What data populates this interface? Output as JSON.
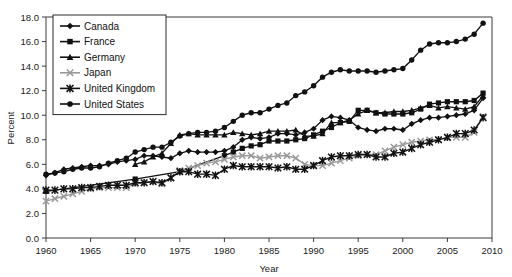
{
  "chart_data": {
    "type": "line",
    "title": "",
    "xlabel": "Year",
    "ylabel": "Percent",
    "xlim": [
      1960,
      2010
    ],
    "ylim": [
      0.0,
      18.0
    ],
    "xticks": [
      "1960",
      "1965",
      "1970",
      "1975",
      "1980",
      "1985",
      "1990",
      "1995",
      "2000",
      "2005",
      "2010"
    ],
    "yticks": [
      "0.0",
      "2.0",
      "4.0",
      "6.0",
      "8.0",
      "10.0",
      "12.0",
      "14.0",
      "16.0",
      "18.0"
    ],
    "grid": false,
    "legend_position": "top-left",
    "series": [
      {
        "name": "Canada",
        "marker": "diamond",
        "color": "#111111",
        "x": [
          1960,
          1961,
          1962,
          1963,
          1964,
          1965,
          1966,
          1967,
          1968,
          1969,
          1970,
          1971,
          1972,
          1973,
          1974,
          1975,
          1976,
          1977,
          1978,
          1979,
          1980,
          1981,
          1982,
          1983,
          1984,
          1985,
          1986,
          1987,
          1988,
          1989,
          1990,
          1991,
          1992,
          1993,
          1994,
          1995,
          1996,
          1997,
          1998,
          1999,
          2000,
          2001,
          2002,
          2003,
          2004,
          2005,
          2006,
          2007,
          2008,
          2009
        ],
        "values": [
          5.1,
          5.3,
          5.6,
          5.7,
          5.8,
          5.9,
          5.9,
          6.0,
          6.2,
          6.3,
          6.4,
          6.7,
          6.7,
          6.6,
          6.5,
          6.9,
          7.1,
          7.0,
          7.0,
          7.0,
          7.1,
          7.4,
          8.0,
          8.2,
          8.1,
          8.2,
          8.5,
          8.5,
          8.4,
          8.6,
          8.9,
          9.6,
          9.9,
          9.8,
          9.6,
          9.0,
          8.8,
          8.7,
          8.9,
          8.9,
          8.8,
          9.3,
          9.6,
          9.8,
          9.8,
          9.9,
          10.0,
          10.1,
          10.4,
          11.4
        ]
      },
      {
        "name": "France",
        "marker": "square",
        "color": "#111111",
        "x": [
          1960,
          1970,
          1975,
          1980,
          1981,
          1982,
          1983,
          1984,
          1985,
          1986,
          1987,
          1988,
          1989,
          1990,
          1991,
          1992,
          1993,
          1994,
          1995,
          1996,
          1997,
          1998,
          1999,
          2000,
          2001,
          2002,
          2003,
          2004,
          2005,
          2006,
          2007,
          2008,
          2009
        ],
        "values": [
          3.8,
          4.8,
          5.4,
          6.7,
          7.0,
          7.3,
          7.5,
          7.6,
          7.9,
          7.9,
          7.9,
          8.0,
          8.1,
          8.4,
          8.7,
          9.0,
          9.4,
          9.5,
          10.4,
          10.4,
          10.2,
          10.1,
          10.1,
          10.1,
          10.2,
          10.5,
          10.9,
          11.0,
          11.1,
          11.1,
          11.1,
          11.2,
          11.8
        ]
      },
      {
        "name": "Germany",
        "marker": "triangle",
        "color": "#111111",
        "x": [
          1970,
          1971,
          1972,
          1973,
          1974,
          1975,
          1976,
          1977,
          1978,
          1979,
          1980,
          1981,
          1982,
          1983,
          1984,
          1985,
          1986,
          1987,
          1988,
          1989,
          1990,
          1991,
          1992,
          1993,
          1994,
          1995,
          1996,
          1997,
          1998,
          1999,
          2000,
          2001,
          2002,
          2003,
          2004,
          2005,
          2006,
          2007,
          2008,
          2009
        ],
        "values": [
          6.0,
          6.2,
          6.6,
          6.9,
          7.7,
          8.4,
          8.5,
          8.4,
          8.4,
          8.4,
          8.4,
          8.6,
          8.5,
          8.4,
          8.5,
          8.7,
          8.7,
          8.7,
          8.8,
          8.3,
          8.3,
          8.5,
          9.4,
          9.4,
          9.6,
          10.1,
          10.4,
          10.2,
          10.2,
          10.3,
          10.3,
          10.4,
          10.6,
          10.8,
          10.6,
          10.7,
          10.6,
          10.5,
          10.7,
          11.6
        ]
      },
      {
        "name": "Japan",
        "marker": "cross",
        "color": "#9a9a9a",
        "x": [
          1960,
          1961,
          1962,
          1963,
          1964,
          1965,
          1966,
          1967,
          1968,
          1969,
          1970,
          1971,
          1972,
          1973,
          1974,
          1975,
          1976,
          1977,
          1978,
          1979,
          1980,
          1981,
          1982,
          1983,
          1984,
          1985,
          1986,
          1987,
          1988,
          1989,
          1990,
          1991,
          1992,
          1993,
          1994,
          1995,
          1996,
          1997,
          1998,
          1999,
          2000,
          2001,
          2002,
          2003,
          2004,
          2005,
          2006,
          2007,
          2008,
          2009
        ],
        "values": [
          3.0,
          3.2,
          3.4,
          3.6,
          3.8,
          4.0,
          4.1,
          4.1,
          4.1,
          4.1,
          4.4,
          4.5,
          4.6,
          4.4,
          4.9,
          5.5,
          5.7,
          5.9,
          6.1,
          6.2,
          6.4,
          6.6,
          6.7,
          6.7,
          6.5,
          6.6,
          6.7,
          6.7,
          6.5,
          6.0,
          5.9,
          5.9,
          6.1,
          6.3,
          6.5,
          6.7,
          6.8,
          6.8,
          7.1,
          7.4,
          7.6,
          7.8,
          7.9,
          8.0,
          8.0,
          8.2,
          8.2,
          8.2,
          8.6,
          9.9
        ]
      },
      {
        "name": "United Kingdom",
        "marker": "asterisk",
        "color": "#111111",
        "x": [
          1960,
          1961,
          1962,
          1963,
          1964,
          1965,
          1966,
          1967,
          1968,
          1969,
          1970,
          1971,
          1972,
          1973,
          1974,
          1975,
          1976,
          1977,
          1978,
          1979,
          1980,
          1981,
          1982,
          1983,
          1984,
          1985,
          1986,
          1987,
          1988,
          1989,
          1990,
          1991,
          1992,
          1993,
          1994,
          1995,
          1996,
          1997,
          1998,
          1999,
          2000,
          2001,
          2002,
          2003,
          2004,
          2005,
          2006,
          2007,
          2008,
          2009
        ],
        "values": [
          3.9,
          3.9,
          4.0,
          4.0,
          4.1,
          4.1,
          4.2,
          4.3,
          4.3,
          4.3,
          4.5,
          4.5,
          4.6,
          4.5,
          4.9,
          5.4,
          5.4,
          5.2,
          5.2,
          5.1,
          5.6,
          5.9,
          5.8,
          5.8,
          5.8,
          5.8,
          5.7,
          5.8,
          5.6,
          5.6,
          5.9,
          6.3,
          6.6,
          6.7,
          6.7,
          6.8,
          6.8,
          6.6,
          6.6,
          6.9,
          7.0,
          7.3,
          7.6,
          7.8,
          8.0,
          8.2,
          8.5,
          8.5,
          8.8,
          9.8
        ]
      },
      {
        "name": "United States",
        "marker": "circle",
        "color": "#111111",
        "x": [
          1960,
          1961,
          1962,
          1963,
          1964,
          1965,
          1966,
          1967,
          1968,
          1969,
          1970,
          1971,
          1972,
          1973,
          1974,
          1975,
          1976,
          1977,
          1978,
          1979,
          1980,
          1981,
          1982,
          1983,
          1984,
          1985,
          1986,
          1987,
          1988,
          1989,
          1990,
          1991,
          1992,
          1993,
          1994,
          1995,
          1996,
          1997,
          1998,
          1999,
          2000,
          2001,
          2002,
          2003,
          2004,
          2005,
          2006,
          2007,
          2008,
          2009
        ],
        "values": [
          5.2,
          5.3,
          5.4,
          5.6,
          5.7,
          5.7,
          5.8,
          6.1,
          6.3,
          6.5,
          7.0,
          7.2,
          7.4,
          7.4,
          7.8,
          8.3,
          8.5,
          8.6,
          8.6,
          8.7,
          9.0,
          9.5,
          10.0,
          10.2,
          10.2,
          10.5,
          10.8,
          11.0,
          11.6,
          11.9,
          12.4,
          13.1,
          13.5,
          13.7,
          13.6,
          13.6,
          13.6,
          13.5,
          13.6,
          13.7,
          13.8,
          14.5,
          15.3,
          15.8,
          15.9,
          15.9,
          16.0,
          16.2,
          16.6,
          17.5
        ]
      }
    ]
  },
  "legend": {
    "entries": [
      {
        "label": "Canada"
      },
      {
        "label": "France"
      },
      {
        "label": "Germany"
      },
      {
        "label": "Japan"
      },
      {
        "label": "United Kingdom"
      },
      {
        "label": "United States"
      }
    ]
  },
  "colors": {
    "axis": "#3a3a3a",
    "text": "#111111",
    "japan_gray": "#9a9a9a",
    "default_black": "#111111",
    "background": "#ffffff"
  }
}
